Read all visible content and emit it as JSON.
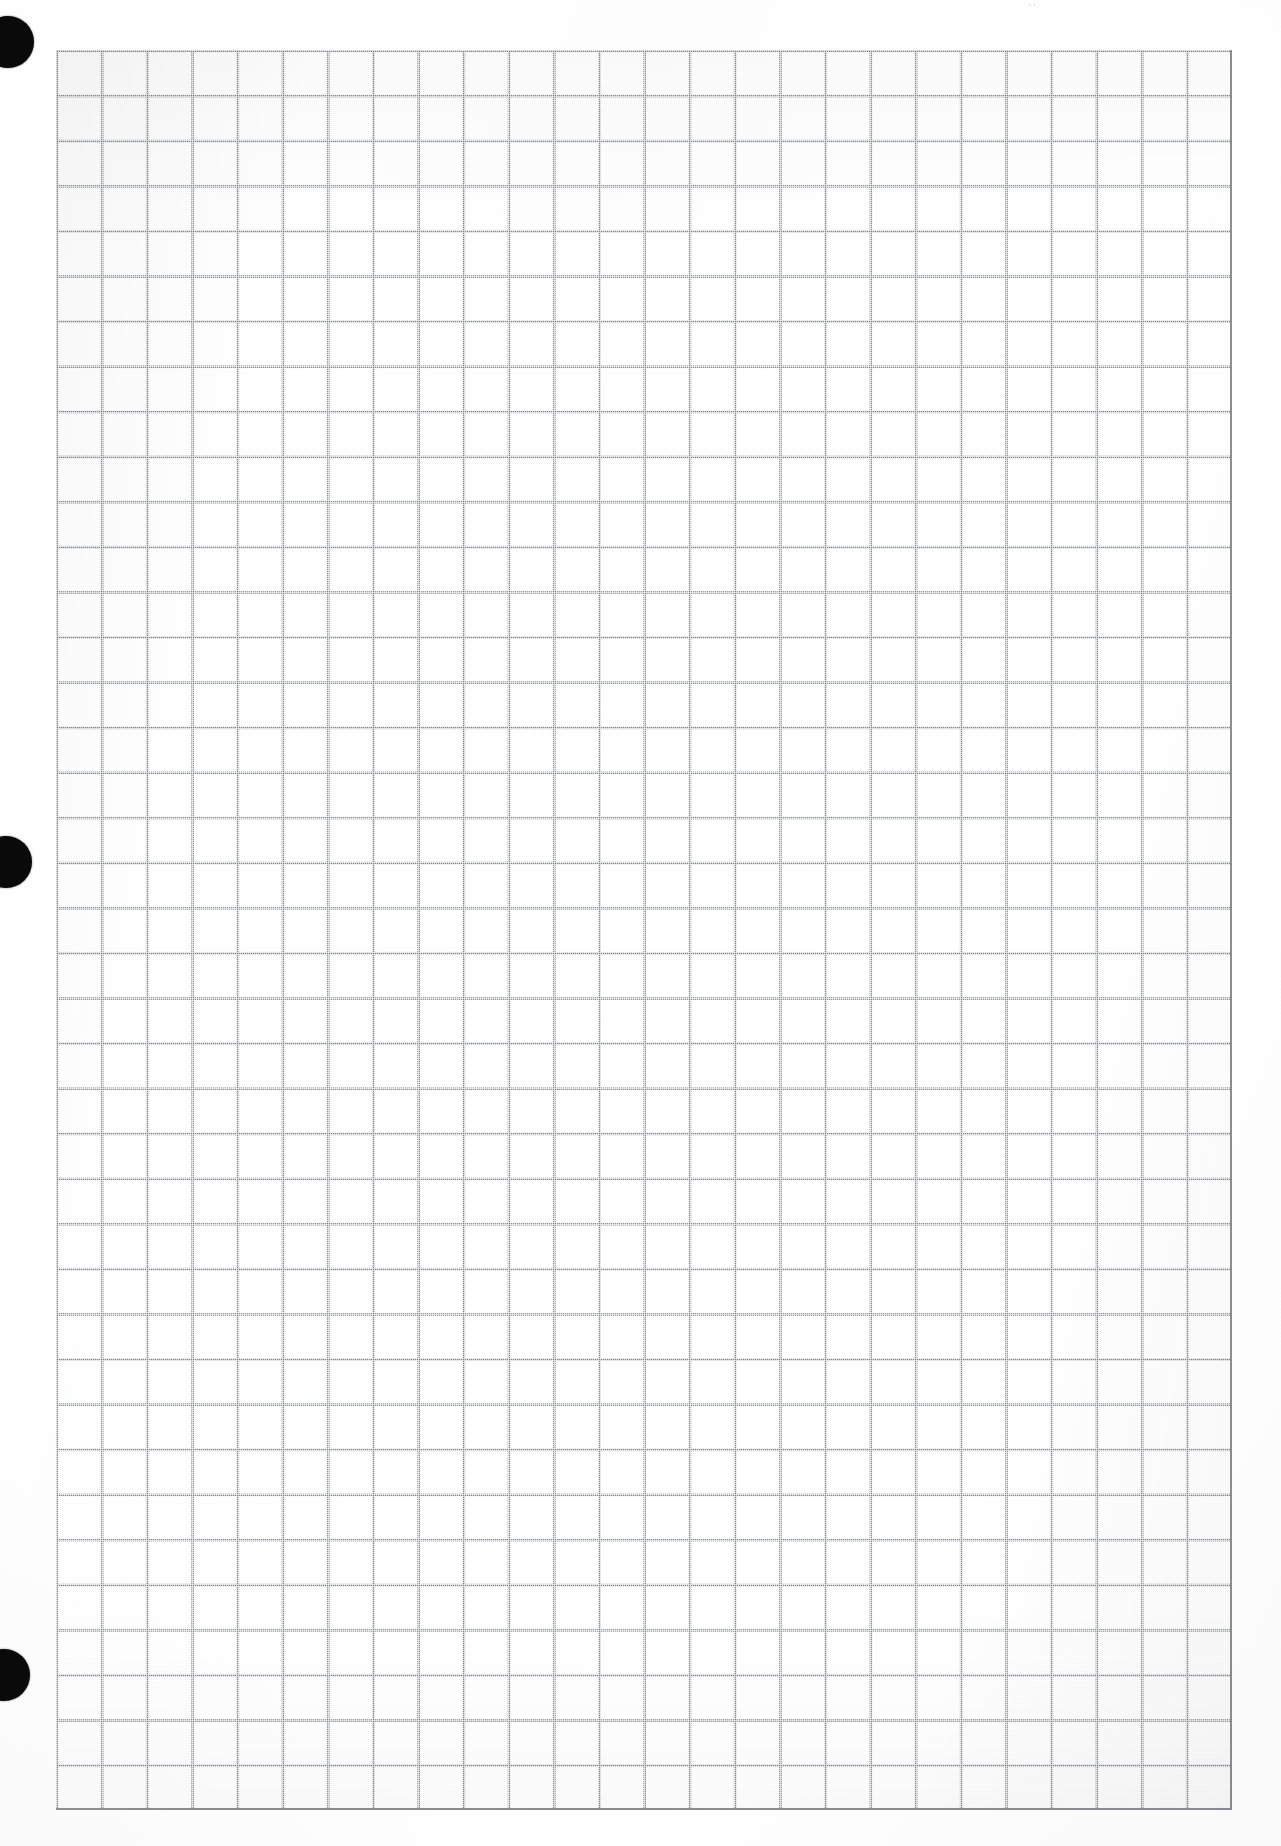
{
  "document": {
    "type": "scanned-graph-paper",
    "title": "Blank squared / graph paper sheet (scan)",
    "page_width": 1281,
    "page_height": 1846,
    "background_color": "#ffffff",
    "paper_tint": "#fdfdfe",
    "content_text": "",
    "handwriting": "none",
    "orientation": "portrait"
  },
  "binder_holes": {
    "name": "three-hole punched margin",
    "count": 3,
    "color": "#0a0a0a",
    "positions": [
      {
        "label": "top-hole",
        "cx": 8,
        "cy": 42,
        "r": 26
      },
      {
        "label": "middle-hole",
        "cx": 6,
        "cy": 862,
        "r": 26
      },
      {
        "label": "bottom-hole",
        "cx": 4,
        "cy": 1675,
        "r": 26
      }
    ]
  },
  "grid": {
    "name": "square-grid",
    "line_color": "#8d8f93",
    "cell_width": 45.23,
    "cell_height": 45.13,
    "columns": 26,
    "rows": 39,
    "left": 56,
    "top": 50,
    "width": 1176,
    "height": 1760,
    "has_major_lines": false,
    "ruling": "uniform square ruling, no emphasised decade lines"
  },
  "margins": {
    "left_margin_px": 56,
    "right_margin_px": 49,
    "top_margin_px": 50,
    "bottom_margin_px": 36
  },
  "artifacts": {
    "scan_mark_label": "··",
    "scan_mark_x": 1028,
    "scan_mark_y": -2,
    "note": "faint dust speck near top edge"
  }
}
